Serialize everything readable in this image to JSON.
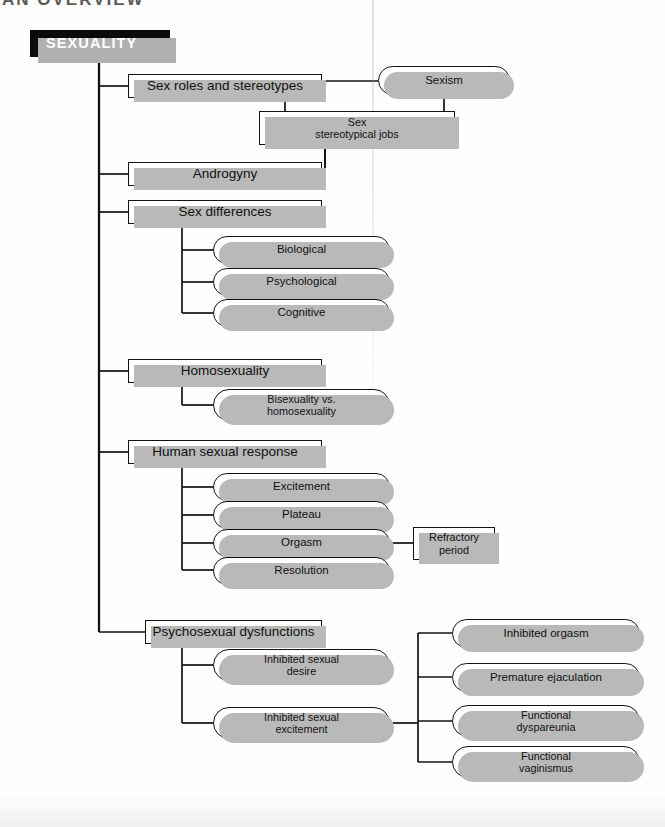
{
  "page": {
    "top_fragment": "AN OVERVIEW",
    "background_color": "#fefefc",
    "line_color": "#121212",
    "shadow_color": "#b9b9b9",
    "root_fill": "#0b0b0b",
    "root_text_color": "#ffffff",
    "node_fill": "#ffffff"
  },
  "diagram": {
    "type": "tree",
    "title": "SEXUALITY",
    "root": {
      "label": "SEXUALITY",
      "shape": "rect-filled"
    },
    "branches": [
      {
        "label": "Sex roles and stereotypes",
        "shape": "rect",
        "children": [
          {
            "label": "Sexism",
            "shape": "pill"
          },
          {
            "label": "Sex\nstereotypical jobs",
            "shape": "rect"
          }
        ]
      },
      {
        "label": "Androgyny",
        "shape": "rect",
        "children": []
      },
      {
        "label": "Sex differences",
        "shape": "rect",
        "children": [
          {
            "label": "Biological",
            "shape": "pill"
          },
          {
            "label": "Psychological",
            "shape": "pill"
          },
          {
            "label": "Cognitive",
            "shape": "pill"
          }
        ]
      },
      {
        "label": "Homosexuality",
        "shape": "rect",
        "children": [
          {
            "label": "Bisexuality vs.\nhomosexuality",
            "shape": "pill"
          }
        ]
      },
      {
        "label": "Human sexual response",
        "shape": "rect",
        "children": [
          {
            "label": "Excitement",
            "shape": "pill"
          },
          {
            "label": "Plateau",
            "shape": "pill"
          },
          {
            "label": "Orgasm",
            "shape": "pill",
            "children": [
              {
                "label": "Refractory\nperiod",
                "shape": "rect"
              }
            ]
          },
          {
            "label": "Resolution",
            "shape": "pill"
          }
        ]
      },
      {
        "label": "Psychosexual dysfunctions",
        "shape": "rect",
        "children": [
          {
            "label": "Inhibited sexual\ndesire",
            "shape": "pill"
          },
          {
            "label": "Inhibited sexual\nexcitement",
            "shape": "pill",
            "children": [
              {
                "label": "Inhibited orgasm",
                "shape": "pill"
              },
              {
                "label": "Premature ejaculation",
                "shape": "pill"
              },
              {
                "label": "Functional\ndyspareunia",
                "shape": "pill"
              },
              {
                "label": "Functional\nvaginismus",
                "shape": "pill"
              }
            ]
          }
        ]
      }
    ]
  },
  "nodes": {
    "root": "SEXUALITY",
    "sex_roles": "Sex roles and stereotypes",
    "sexism": "Sexism",
    "stereotypical_jobs_l1": "Sex",
    "stereotypical_jobs_l2": "stereotypical jobs",
    "androgyny": "Androgyny",
    "sex_differences": "Sex differences",
    "biological": "Biological",
    "psychological": "Psychological",
    "cognitive": "Cognitive",
    "homosexuality": "Homosexuality",
    "bisexuality_l1": "Bisexuality vs.",
    "bisexuality_l2": "homosexuality",
    "human_sexual_response": "Human sexual response",
    "excitement": "Excitement",
    "plateau": "Plateau",
    "orgasm": "Orgasm",
    "refractory_l1": "Refractory",
    "refractory_l2": "period",
    "resolution": "Resolution",
    "psychosexual": "Psychosexual dysfunctions",
    "inhibited_desire_l1": "Inhibited sexual",
    "inhibited_desire_l2": "desire",
    "inhibited_excitement_l1": "Inhibited sexual",
    "inhibited_excitement_l2": "excitement",
    "inhibited_orgasm": "Inhibited orgasm",
    "premature_ejaculation": "Premature ejaculation",
    "functional_dyspareunia_l1": "Functional",
    "functional_dyspareunia_l2": "dyspareunia",
    "functional_vaginismus_l1": "Functional",
    "functional_vaginismus_l2": "vaginismus"
  }
}
